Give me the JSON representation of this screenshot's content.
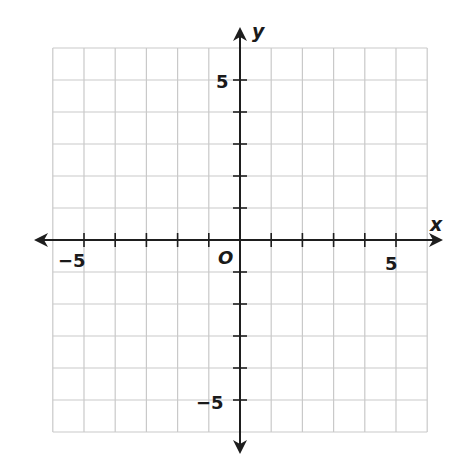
{
  "chart_data": {
    "type": "coordinate-plane",
    "title": "",
    "xlabel": "x",
    "ylabel": "y",
    "origin_label": "O",
    "xlim": [
      -6,
      6
    ],
    "ylim": [
      -6,
      6
    ],
    "grid": true,
    "grid_step": 1,
    "x_tick_labels": [
      {
        "value": -5,
        "text": "−5"
      },
      {
        "value": 5,
        "text": "5"
      }
    ],
    "y_tick_labels": [
      {
        "value": 5,
        "text": "5"
      },
      {
        "value": -5,
        "text": "−5"
      }
    ],
    "series": []
  },
  "colors": {
    "grid": "#c9c9c9",
    "axis": "#1e1e1e",
    "background": "#ffffff"
  },
  "layout": {
    "origin_px": [
      240,
      240
    ],
    "unit_x_px": 31.2,
    "unit_y_px": 32,
    "x_arrow_left": 34,
    "x_arrow_right": 443,
    "y_arrow_top": 27,
    "y_arrow_bottom": 454
  }
}
